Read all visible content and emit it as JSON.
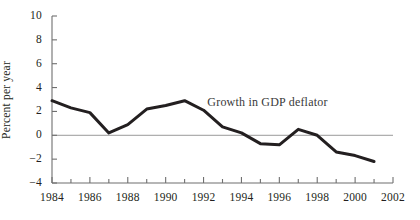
{
  "chart_data": {
    "type": "line",
    "title": "",
    "subtitle": "",
    "xlabel": "",
    "ylabel": "Percent per year",
    "xlim": [
      1984,
      2002
    ],
    "ylim": [
      -4,
      10
    ],
    "grid": false,
    "zero_line": true,
    "legend": "none",
    "annotations": [
      {
        "text": "Growth in GDP deflator",
        "x": 1992.2,
        "y": 2.85
      }
    ],
    "x": [
      1984,
      1985,
      1986,
      1987,
      1988,
      1989,
      1990,
      1991,
      1992,
      1993,
      1994,
      1995,
      1996,
      1997,
      1998,
      1999,
      2000,
      2001
    ],
    "series": [
      {
        "name": "Growth in GDP deflator",
        "color": "#231f20",
        "values": [
          2.9,
          2.3,
          1.9,
          0.2,
          0.9,
          2.2,
          2.5,
          2.9,
          2.1,
          0.7,
          0.2,
          -0.7,
          -0.8,
          0.5,
          0.0,
          -1.4,
          -1.7,
          -2.2
        ]
      }
    ],
    "x_ticks_all": [
      1984,
      1985,
      1986,
      1987,
      1988,
      1989,
      1990,
      1991,
      1992,
      1993,
      1994,
      1995,
      1996,
      1997,
      1998,
      1999,
      2000,
      2001,
      2002
    ],
    "x_tick_labels": [
      "1984",
      "1986",
      "1988",
      "1990",
      "1992",
      "1994",
      "1996",
      "1998",
      "2000",
      "2002"
    ],
    "x_tick_label_values": [
      1984,
      1986,
      1988,
      1990,
      1992,
      1994,
      1996,
      1998,
      2000,
      2002
    ],
    "y_ticks": [
      -4,
      -2,
      0,
      2,
      4,
      6,
      8,
      10
    ],
    "y_tick_labels": [
      "−4",
      "−2",
      "0",
      "2",
      "4",
      "6",
      "8",
      "10"
    ]
  },
  "style": {
    "background": "#ffffff",
    "axis_color": "#6f6f6f",
    "line_color": "#231f20",
    "zero_line_color": "#9a9a9a",
    "text_color": "#231f20"
  }
}
